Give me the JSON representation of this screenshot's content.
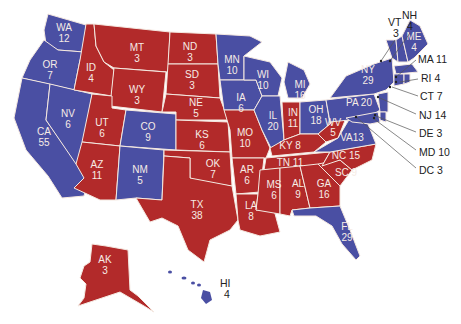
{
  "map": {
    "title": "US Electoral College Map",
    "colors": {
      "red": "#b22a2a",
      "blue": "#4a4fa3",
      "border": "#f4e8e0",
      "leader": "#555555"
    },
    "states": {
      "WA": {
        "label": "WA",
        "votes": "12",
        "party": "blue"
      },
      "OR": {
        "label": "OR",
        "votes": "7",
        "party": "blue"
      },
      "CA": {
        "label": "CA",
        "votes": "55",
        "party": "blue"
      },
      "NV": {
        "label": "NV",
        "votes": "6",
        "party": "blue"
      },
      "ID": {
        "label": "ID",
        "votes": "4",
        "party": "red"
      },
      "MT": {
        "label": "MT",
        "votes": "3",
        "party": "red"
      },
      "WY": {
        "label": "WY",
        "votes": "3",
        "party": "red"
      },
      "UT": {
        "label": "UT",
        "votes": "6",
        "party": "red"
      },
      "AZ": {
        "label": "AZ",
        "votes": "11",
        "party": "red"
      },
      "CO": {
        "label": "CO",
        "votes": "9",
        "party": "blue"
      },
      "NM": {
        "label": "NM",
        "votes": "5",
        "party": "blue"
      },
      "ND": {
        "label": "ND",
        "votes": "3",
        "party": "red"
      },
      "SD": {
        "label": "SD",
        "votes": "3",
        "party": "red"
      },
      "NE": {
        "label": "NE",
        "votes": "5",
        "party": "red"
      },
      "KS": {
        "label": "KS",
        "votes": "6",
        "party": "red"
      },
      "OK": {
        "label": "OK",
        "votes": "7",
        "party": "red"
      },
      "TX": {
        "label": "TX",
        "votes": "38",
        "party": "red"
      },
      "MN": {
        "label": "MN",
        "votes": "10",
        "party": "blue"
      },
      "IA": {
        "label": "IA",
        "votes": "6",
        "party": "blue"
      },
      "MO": {
        "label": "MO",
        "votes": "10",
        "party": "red"
      },
      "AR": {
        "label": "AR",
        "votes": "6",
        "party": "red"
      },
      "LA": {
        "label": "LA",
        "votes": "8",
        "party": "red"
      },
      "WI": {
        "label": "WI",
        "votes": "10",
        "party": "blue"
      },
      "IL": {
        "label": "IL",
        "votes": "20",
        "party": "blue"
      },
      "MI": {
        "label": "MI",
        "votes": "16",
        "party": "blue"
      },
      "IN": {
        "label": "IN",
        "votes": "11",
        "party": "red"
      },
      "OH": {
        "label": "OH",
        "votes": "18",
        "party": "blue"
      },
      "KY": {
        "label": "KY",
        "votes": "8",
        "party": "red"
      },
      "TN": {
        "label": "TN",
        "votes": "11",
        "party": "red"
      },
      "MS": {
        "label": "MS",
        "votes": "6",
        "party": "red"
      },
      "AL": {
        "label": "AL",
        "votes": "9",
        "party": "red"
      },
      "GA": {
        "label": "GA",
        "votes": "16",
        "party": "red"
      },
      "FL": {
        "label": "FL",
        "votes": "29",
        "party": "blue"
      },
      "SC": {
        "label": "SC",
        "votes": "9",
        "party": "red"
      },
      "NC": {
        "label": "NC",
        "votes": "15",
        "party": "red"
      },
      "VA": {
        "label": "VA",
        "votes": "13",
        "party": "blue"
      },
      "WV": {
        "label": "WV",
        "votes": "5",
        "party": "red"
      },
      "PA": {
        "label": "PA",
        "votes": "20",
        "party": "blue"
      },
      "NY": {
        "label": "NY",
        "votes": "29",
        "party": "blue"
      },
      "VT": {
        "label": "VT",
        "votes": "3",
        "party": "blue"
      },
      "NH": {
        "label": "NH",
        "votes": "4",
        "party": "blue"
      },
      "ME": {
        "label": "ME",
        "votes": "4",
        "party": "blue"
      },
      "MA": {
        "label": "MA",
        "votes": "11",
        "party": "blue"
      },
      "RI": {
        "label": "RI",
        "votes": "4",
        "party": "blue"
      },
      "CT": {
        "label": "CT",
        "votes": "7",
        "party": "blue"
      },
      "NJ": {
        "label": "NJ",
        "votes": "14",
        "party": "blue"
      },
      "DE": {
        "label": "DE",
        "votes": "3",
        "party": "blue"
      },
      "MD": {
        "label": "MD",
        "votes": "10",
        "party": "blue"
      },
      "DC": {
        "label": "DC",
        "votes": "3",
        "party": "blue"
      },
      "AK": {
        "label": "AK",
        "votes": "3",
        "party": "red"
      },
      "HI": {
        "label": "HI",
        "votes": "4",
        "party": "blue"
      }
    },
    "callouts": {
      "MA": "MA 11",
      "RI": "RI 4",
      "CT": "CT 7",
      "NJ": "NJ 14",
      "DE": "DE 3",
      "MD": "MD 10",
      "DC": "DC 3"
    }
  }
}
